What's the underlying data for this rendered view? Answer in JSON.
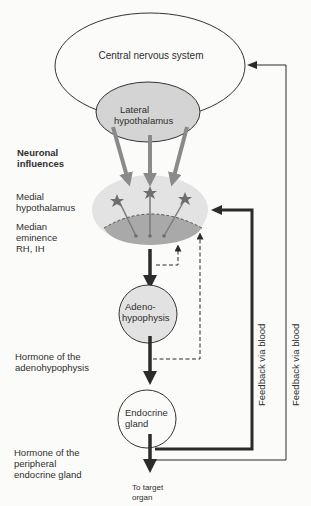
{
  "nodes": {
    "cns": {
      "label": "Central nervous system"
    },
    "lateral_hypothalamus": {
      "line1": "Lateral",
      "line2": "hypothalamus"
    },
    "adenohypophysis": {
      "line1": "Adeno-",
      "line2": "hypophysis"
    },
    "endocrine_gland": {
      "line1": "Endocrine",
      "line2": "gland"
    }
  },
  "side_labels": {
    "neuronal": {
      "line1": "Neuronal",
      "line2": "influences"
    },
    "medial": {
      "line1": "Medial",
      "line2": "hypothalamus"
    },
    "median": {
      "line1": "Median",
      "line2": "eminence",
      "line3": "RH,  IH"
    },
    "hormone_adeno": {
      "line1": "Hormone of the",
      "line2": "adenohypophysis"
    },
    "hormone_peripheral": {
      "line1": "Hormone of the",
      "line2": "peripheral",
      "line3": "endocrine gland"
    }
  },
  "target": {
    "line1": "To target",
    "line2": "organ"
  },
  "feedback": {
    "inner": "Feedback via blood",
    "outer": "Feedback via blood"
  },
  "colors": {
    "lateral_fill": "#d4d4d4",
    "medial_fill": "#e3e3e3",
    "eminence_fill": "#a9a9a9",
    "adeno_fill": "#e2e2e2",
    "arrow_grey": "#8a8a8a",
    "arrow_dark": "#2b2b2b"
  }
}
